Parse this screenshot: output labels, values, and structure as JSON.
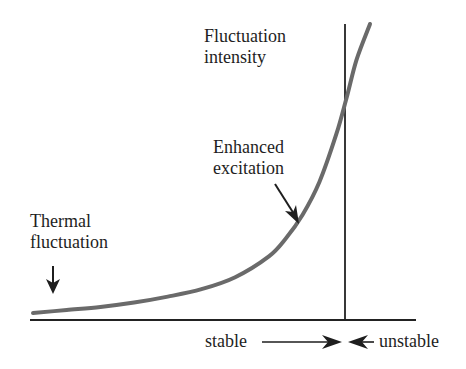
{
  "chart_data": {
    "type": "line",
    "title": "",
    "ylabel": [
      "Fluctuation",
      "intensity"
    ],
    "xlabel": "",
    "x": [
      0,
      0.1,
      0.2,
      0.3,
      0.4,
      0.5,
      0.6,
      0.7,
      0.75,
      0.8,
      0.85,
      0.9,
      0.93,
      0.96,
      1.0
    ],
    "series": [
      {
        "name": "fluctuation-intensity",
        "values": [
          0.03,
          0.04,
          0.05,
          0.065,
          0.085,
          0.11,
          0.15,
          0.22,
          0.28,
          0.36,
          0.47,
          0.63,
          0.75,
          0.88,
          1.0
        ]
      }
    ],
    "threshold_x": 0.93,
    "xlim": [
      0,
      1.15
    ],
    "ylim": [
      0,
      1
    ],
    "annotations": [
      {
        "lines": [
          "Thermal",
          "fluctuation"
        ],
        "arrow": "down"
      },
      {
        "lines": [
          "Enhanced",
          "excitation"
        ],
        "arrow": "down-right"
      }
    ],
    "regions": {
      "stable": "stable",
      "unstable": "unstable"
    },
    "grid": false,
    "legend": "none"
  }
}
